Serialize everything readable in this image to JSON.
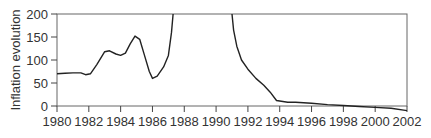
{
  "chart_data": {
    "type": "line",
    "title": "",
    "xlabel": "",
    "ylabel": "Inflation evolution",
    "xlim": [
      1980,
      2002
    ],
    "ylim": [
      0,
      200
    ],
    "grid": false,
    "legend": null,
    "x_ticks": [
      "1980",
      "1982",
      "1984",
      "1986",
      "1988",
      "1990",
      "1992",
      "1994",
      "1996",
      "1998",
      "2000",
      "2002"
    ],
    "y_ticks": [
      "0",
      "50",
      "100",
      "150",
      "200"
    ],
    "series": [
      {
        "name": "Inflation evolution",
        "segments": [
          {
            "x": [
              1980,
              1980.5,
              1981,
              1981.5,
              1981.8,
              1982.1,
              1982.5,
              1983,
              1983.3,
              1983.7,
              1984,
              1984.3,
              1984.6,
              1984.9,
              1985.2,
              1985.5,
              1985.8,
              1986,
              1986.3,
              1986.7,
              1987,
              1987.2,
              1987.3
            ],
            "y": [
              70,
              71,
              72,
              72,
              68,
              70,
              90,
              118,
              120,
              113,
              110,
              115,
              135,
              152,
              145,
              110,
              75,
              60,
              65,
              85,
              110,
              160,
              200
            ]
          },
          {
            "x": [
              1991,
              1991.1,
              1991.3,
              1991.6,
              1992,
              1992.5,
              1993,
              1993.4,
              1993.8,
              1994.5,
              1995,
              1996,
              1997,
              1998,
              1999,
              2000,
              2001,
              2002
            ],
            "y": [
              200,
              165,
              130,
              100,
              80,
              60,
              45,
              30,
              12,
              8,
              8,
              6,
              3,
              1,
              -1,
              -3,
              -5,
              -10
            ]
          }
        ]
      }
    ]
  }
}
